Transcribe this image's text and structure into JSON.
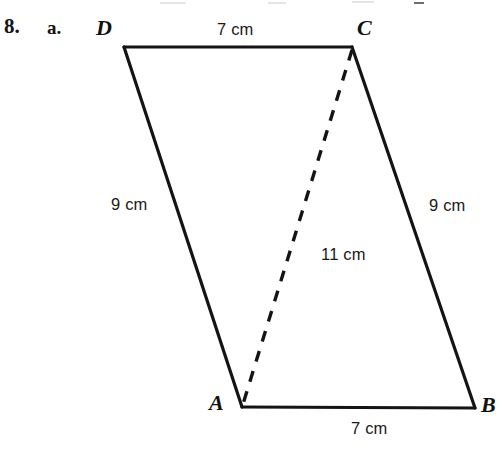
{
  "problem": {
    "number": "8.",
    "part": "a."
  },
  "figure": {
    "name": "parallelogram-abcd",
    "vertices": [
      {
        "id": "D",
        "label": "D",
        "x": 124,
        "y": 47
      },
      {
        "id": "C",
        "label": "C",
        "x": 352,
        "y": 47
      },
      {
        "id": "B",
        "label": "B",
        "x": 475,
        "y": 408
      },
      {
        "id": "A",
        "label": "A",
        "x": 242,
        "y": 407
      }
    ],
    "sides": [
      {
        "name": "DC",
        "from": "D",
        "to": "C",
        "length_label": "7 cm",
        "style": "solid"
      },
      {
        "name": "CB",
        "from": "C",
        "to": "B",
        "length_label": "9 cm",
        "style": "solid"
      },
      {
        "name": "AB",
        "from": "A",
        "to": "B",
        "length_label": "7 cm",
        "style": "solid"
      },
      {
        "name": "DA",
        "from": "D",
        "to": "A",
        "length_label": "9 cm",
        "style": "solid"
      }
    ],
    "diagonal": {
      "name": "AC",
      "from": "C",
      "to": "A",
      "length_label": "11 cm",
      "style": "dashed"
    },
    "labels": {
      "top_side": "7 cm",
      "left_side": "9 cm",
      "right_side": "9 cm",
      "diagonal": "11 cm",
      "bottom_side": "7 cm"
    },
    "colors": {
      "stroke": "#141414",
      "background": "#ffffff",
      "text": "#1a1a1a"
    }
  }
}
